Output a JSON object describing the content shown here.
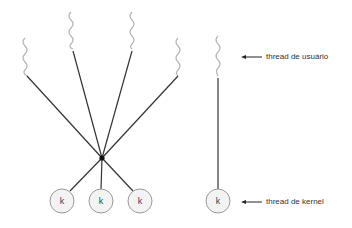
{
  "diagram": {
    "type": "many-to-one threading model vs one-to-one",
    "colors": {
      "thread_line": "#333333",
      "squiggle": "#b0b0b0",
      "circle_fill": "#f2f2f2",
      "circle_stroke": "#999999",
      "junction": "#111111"
    },
    "many_to_one": {
      "user_threads": 4,
      "kernel_threads": [
        {
          "label": "k"
        },
        {
          "label": "k"
        },
        {
          "label": "k"
        }
      ]
    },
    "one_to_one": {
      "kernel_thread": {
        "label": "k"
      }
    },
    "labels": {
      "user_thread": "thread de usuário",
      "kernel_thread": "thread de kernel"
    }
  }
}
